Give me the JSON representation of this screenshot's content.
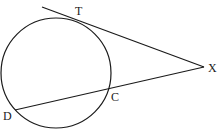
{
  "diagram": {
    "type": "geometry",
    "stroke_color": "#1a1a1a",
    "background_color": "#ffffff",
    "circle": {
      "cx": 56,
      "cy": 73,
      "r": 55
    },
    "tangent_line": {
      "x1": 42,
      "y1": 7,
      "x2": 204,
      "y2": 67
    },
    "secant_line": {
      "x1": 15,
      "y1": 110,
      "x2": 204,
      "y2": 67
    },
    "points": {
      "T": {
        "label": "T",
        "x": 77,
        "y": 19
      },
      "X": {
        "label": "X",
        "x": 204,
        "y": 67
      },
      "C": {
        "label": "C",
        "x": 108,
        "y": 89
      },
      "D": {
        "label": "D",
        "x": 15,
        "y": 110
      }
    }
  }
}
